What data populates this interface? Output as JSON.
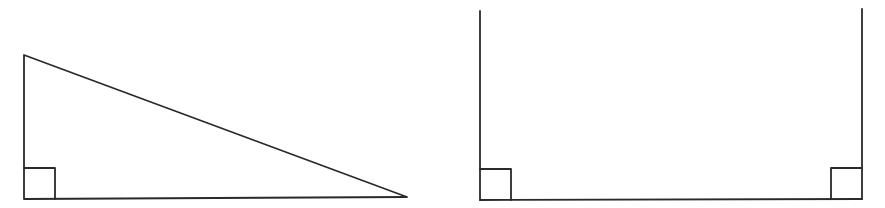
{
  "diagram": {
    "canvas": {
      "width": 885,
      "height": 208,
      "background": "#ffffff"
    },
    "stroke_color": "#2a2a2a",
    "figures": [
      {
        "id": "right-triangle",
        "type": "right-triangle",
        "vertices": [
          [
            24,
            55
          ],
          [
            24,
            199
          ],
          [
            407,
            197
          ]
        ],
        "right_angle_markers": [
          {
            "corner": [
              24,
              199
            ],
            "size": 31
          }
        ]
      },
      {
        "id": "open-rectangle",
        "type": "u-shape-open-top",
        "left_side": {
          "x": 480,
          "y_top": 11,
          "y_bottom": 200
        },
        "right_side": {
          "x": 862,
          "y_top": 9,
          "y_bottom": 199
        },
        "base": {
          "y": 200,
          "x_start": 480,
          "x_end": 862
        },
        "right_angle_markers": [
          {
            "corner": [
              480,
              200
            ],
            "size": 31
          },
          {
            "corner": [
              862,
              199
            ],
            "size": 31
          }
        ]
      }
    ]
  }
}
